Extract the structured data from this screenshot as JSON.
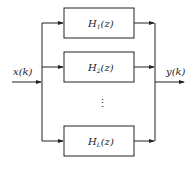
{
  "diagram": {
    "input_label": "x(k)",
    "output_label": "y(k)",
    "ellipsis": "⋮",
    "blocks": [
      {
        "symbol": "H",
        "subscript": "1",
        "arg": "(z)"
      },
      {
        "symbol": "H",
        "subscript": "2",
        "arg": "(z)"
      },
      {
        "symbol": "H",
        "subscript": "L",
        "arg": "(z)"
      }
    ],
    "stroke_color": "#222222"
  }
}
